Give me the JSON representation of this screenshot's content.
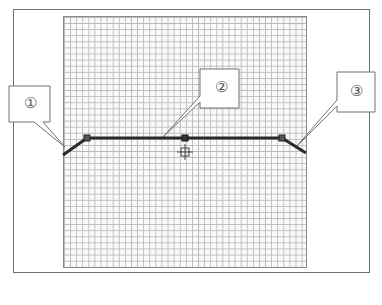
{
  "diagram": {
    "type": "section-line-on-grid",
    "frame": {
      "x": 13,
      "y": 9,
      "width": 357,
      "height": 264
    },
    "grid": {
      "x": 63,
      "y": 16,
      "width": 244,
      "height": 252,
      "cell": 6.1
    },
    "polyline": [
      [
        63,
        155
      ],
      [
        87,
        138
      ],
      [
        185,
        138
      ],
      [
        282,
        138
      ],
      [
        306,
        153
      ]
    ],
    "nodes": [
      [
        87,
        138
      ],
      [
        185,
        138
      ],
      [
        282,
        138
      ]
    ],
    "crosshair": [
      185,
      152
    ],
    "colors": {
      "line": "#2a2a2a",
      "frame": "#6e6e6e",
      "grid": "#b9b9b9",
      "callout": "#707070"
    }
  },
  "callouts": [
    {
      "label": "①",
      "box": {
        "x": 9,
        "y": 86,
        "w": 41,
        "h": 36
      },
      "tip": [
        65,
        147
      ]
    },
    {
      "label": "②",
      "box": {
        "x": 200,
        "y": 69,
        "w": 39,
        "h": 39
      },
      "tip": [
        163,
        137
      ]
    },
    {
      "label": "③",
      "box": {
        "x": 337,
        "y": 72,
        "w": 38,
        "h": 40
      },
      "tip": [
        296,
        147
      ]
    }
  ]
}
